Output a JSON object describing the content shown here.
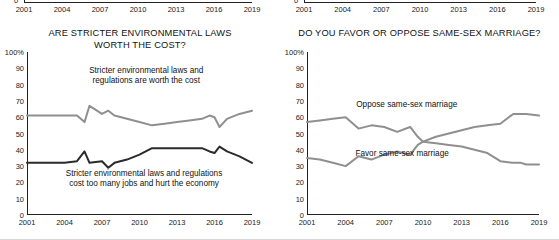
{
  "figure": {
    "background": "#ffffff",
    "colors": {
      "dark_line": "#2b2b2b",
      "gray_line": "#8f8f8f",
      "axis": "#222222"
    }
  },
  "cut_off_strip": {
    "note": "bottom edge of the preceding chart pair, only zero label and x axis visible",
    "zero_label": "0",
    "ticks": [
      "2001",
      "2004",
      "2007",
      "2010",
      "2013",
      "2016",
      "2019"
    ]
  },
  "chart_data": [
    {
      "type": "line",
      "title": "ARE STRICTER ENVIRONMENTAL LAWS WORTH THE COST?",
      "title_lines": [
        "ARE STRICTER ENVIRONMENTAL LAWS",
        "WORTH THE COST?"
      ],
      "xlabel": "",
      "ylabel": "",
      "ylim": [
        0,
        100
      ],
      "yticks": [
        0,
        10,
        20,
        30,
        40,
        50,
        60,
        70,
        80,
        90,
        100
      ],
      "ytick_labels": [
        "0",
        "10",
        "20",
        "30",
        "40",
        "50",
        "60",
        "70",
        "80",
        "90",
        "100%"
      ],
      "xlim": [
        2001,
        2019
      ],
      "xticks": [
        2001,
        2004,
        2007,
        2010,
        2013,
        2016,
        2019
      ],
      "xtick_labels": [
        "2001",
        "2004",
        "2007",
        "2010",
        "2013",
        "2016",
        "2019"
      ],
      "grid": false,
      "legend": "inline-annotations",
      "x": [
        2001,
        2002,
        2003,
        2004,
        2005,
        2005.6,
        2006,
        2007,
        2007.5,
        2008,
        2009,
        2010,
        2011,
        2012,
        2013,
        2014,
        2015,
        2015.6,
        2016,
        2016.4,
        2017,
        2018,
        2019
      ],
      "series": [
        {
          "name": "Stricter environmental laws and regulations are worth the cost",
          "color": "#8f8f8f",
          "annotation_lines": [
            "Stricter environmental laws and",
            "regulations are worth the cost"
          ],
          "values": [
            61,
            61,
            61,
            61,
            61,
            57,
            67,
            62,
            64,
            61,
            59,
            57,
            55,
            56,
            57,
            58,
            59,
            61,
            60,
            54,
            59,
            62,
            64
          ]
        },
        {
          "name": "Stricter environmental laws and regulations cost too many jobs and hurt the economy",
          "color": "#2b2b2b",
          "annotation_lines": [
            "Stricter environmental laws and regulations",
            "cost too many jobs and hurt the economy"
          ],
          "values": [
            32,
            32,
            32,
            32,
            33,
            39,
            32,
            33,
            29,
            32,
            34,
            37,
            41,
            41,
            41,
            41,
            41,
            39,
            38,
            42,
            39,
            36,
            32
          ]
        }
      ]
    },
    {
      "type": "line",
      "title": "DO YOU FAVOR OR OPPOSE SAME-SEX MARRIAGE?",
      "title_lines": [
        "DO YOU FAVOR OR OPPOSE SAME-SEX MARRIAGE?"
      ],
      "xlabel": "",
      "ylabel": "",
      "ylim": [
        0,
        100
      ],
      "yticks": [
        0,
        10,
        20,
        30,
        40,
        50,
        60,
        70,
        80,
        90,
        100
      ],
      "ytick_labels": [
        "0",
        "10",
        "20",
        "30",
        "40",
        "50",
        "60",
        "70",
        "80",
        "90",
        "100%"
      ],
      "xlim": [
        2001,
        2019
      ],
      "xticks": [
        2001,
        2004,
        2007,
        2010,
        2013,
        2016,
        2019
      ],
      "xtick_labels": [
        "2001",
        "2004",
        "2007",
        "2010",
        "2013",
        "2016",
        "2019"
      ],
      "grid": false,
      "legend": "inline-annotations",
      "x": [
        2001,
        2002,
        2003,
        2004,
        2005,
        2006,
        2007,
        2008,
        2009,
        2009.6,
        2010,
        2011,
        2012,
        2013,
        2014,
        2015,
        2016,
        2017,
        2017.6,
        2018,
        2019
      ],
      "series": [
        {
          "name": "Oppose same-sex marriage",
          "color": "#8f8f8f",
          "annotation_lines": [
            "Oppose same-sex marriage"
          ],
          "values": [
            57,
            58,
            59,
            60,
            53,
            55,
            54,
            51,
            54,
            48,
            45,
            44,
            43,
            42,
            40,
            38,
            33,
            32,
            32,
            31,
            31
          ]
        },
        {
          "name": "Favor same-sex marriage",
          "color": "#8f8f8f",
          "annotation_lines": [
            "Favor same-sex marriage"
          ],
          "values": [
            35,
            34,
            32,
            30,
            36,
            34,
            37,
            39,
            37,
            43,
            45,
            48,
            50,
            52,
            54,
            55,
            56,
            62,
            62,
            62,
            61
          ]
        }
      ]
    }
  ]
}
